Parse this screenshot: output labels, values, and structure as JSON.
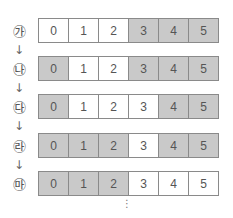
{
  "diagram": {
    "colors": {
      "shaded": "#c9c9c9",
      "unshaded": "#ffffff",
      "border": "#8a8a8a",
      "text": "#555555"
    },
    "rows": [
      {
        "label": "㉮",
        "cells": [
          {
            "value": "0",
            "shaded": false
          },
          {
            "value": "1",
            "shaded": false
          },
          {
            "value": "2",
            "shaded": false
          },
          {
            "value": "3",
            "shaded": true
          },
          {
            "value": "4",
            "shaded": true
          },
          {
            "value": "5",
            "shaded": true
          }
        ]
      },
      {
        "label": "㉯",
        "cells": [
          {
            "value": "0",
            "shaded": true
          },
          {
            "value": "1",
            "shaded": false
          },
          {
            "value": "2",
            "shaded": false
          },
          {
            "value": "3",
            "shaded": true
          },
          {
            "value": "4",
            "shaded": true
          },
          {
            "value": "5",
            "shaded": true
          }
        ]
      },
      {
        "label": "㉰",
        "cells": [
          {
            "value": "0",
            "shaded": true
          },
          {
            "value": "1",
            "shaded": false
          },
          {
            "value": "2",
            "shaded": false
          },
          {
            "value": "3",
            "shaded": false
          },
          {
            "value": "4",
            "shaded": true
          },
          {
            "value": "5",
            "shaded": true
          }
        ]
      },
      {
        "label": "㉱",
        "cells": [
          {
            "value": "0",
            "shaded": true
          },
          {
            "value": "1",
            "shaded": true
          },
          {
            "value": "2",
            "shaded": true
          },
          {
            "value": "3",
            "shaded": false
          },
          {
            "value": "4",
            "shaded": true
          },
          {
            "value": "5",
            "shaded": true
          }
        ]
      },
      {
        "label": "㉲",
        "cells": [
          {
            "value": "0",
            "shaded": true
          },
          {
            "value": "1",
            "shaded": true
          },
          {
            "value": "2",
            "shaded": true
          },
          {
            "value": "3",
            "shaded": false
          },
          {
            "value": "4",
            "shaded": false
          },
          {
            "value": "5",
            "shaded": false
          }
        ]
      }
    ],
    "arrow_glyph": "↓",
    "continuation_glyph": "⋮"
  }
}
